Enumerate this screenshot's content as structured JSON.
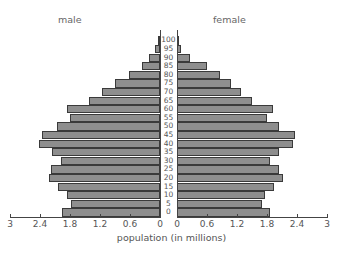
{
  "chart_data": {
    "type": "bar",
    "subtype": "population-pyramid",
    "title": "",
    "xlabel": "population (in millions)",
    "ylabel": "",
    "categories": [
      "0",
      "5",
      "10",
      "15",
      "20",
      "25",
      "30",
      "35",
      "40",
      "45",
      "50",
      "55",
      "60",
      "65",
      "70",
      "75",
      "80",
      "85",
      "90",
      "95",
      "100"
    ],
    "series": [
      {
        "name": "male",
        "values": [
          1.96,
          1.78,
          1.86,
          2.04,
          2.22,
          2.18,
          1.98,
          2.16,
          2.42,
          2.36,
          2.06,
          1.8,
          1.86,
          1.42,
          1.16,
          0.9,
          0.62,
          0.36,
          0.22,
          0.1,
          0.04
        ]
      },
      {
        "name": "female",
        "values": [
          1.86,
          1.7,
          1.76,
          1.94,
          2.12,
          2.04,
          1.86,
          2.04,
          2.32,
          2.36,
          2.04,
          1.8,
          1.92,
          1.5,
          1.28,
          1.08,
          0.86,
          0.6,
          0.26,
          0.08,
          0.04
        ]
      }
    ],
    "xlim": [
      0,
      3
    ],
    "x_ticks_male": [
      "3",
      "2.4",
      "1.8",
      "1.2",
      "0.6",
      "0"
    ],
    "x_ticks_female": [
      "0",
      "0.6",
      "1.2",
      "1.8",
      "2.4",
      "3"
    ],
    "grid": false,
    "legend": {
      "left": "male",
      "right": "female"
    },
    "bar_color": "#8e8e8e"
  },
  "labels": {
    "male": "male",
    "female": "female",
    "xlabel": "population (in millions)"
  }
}
